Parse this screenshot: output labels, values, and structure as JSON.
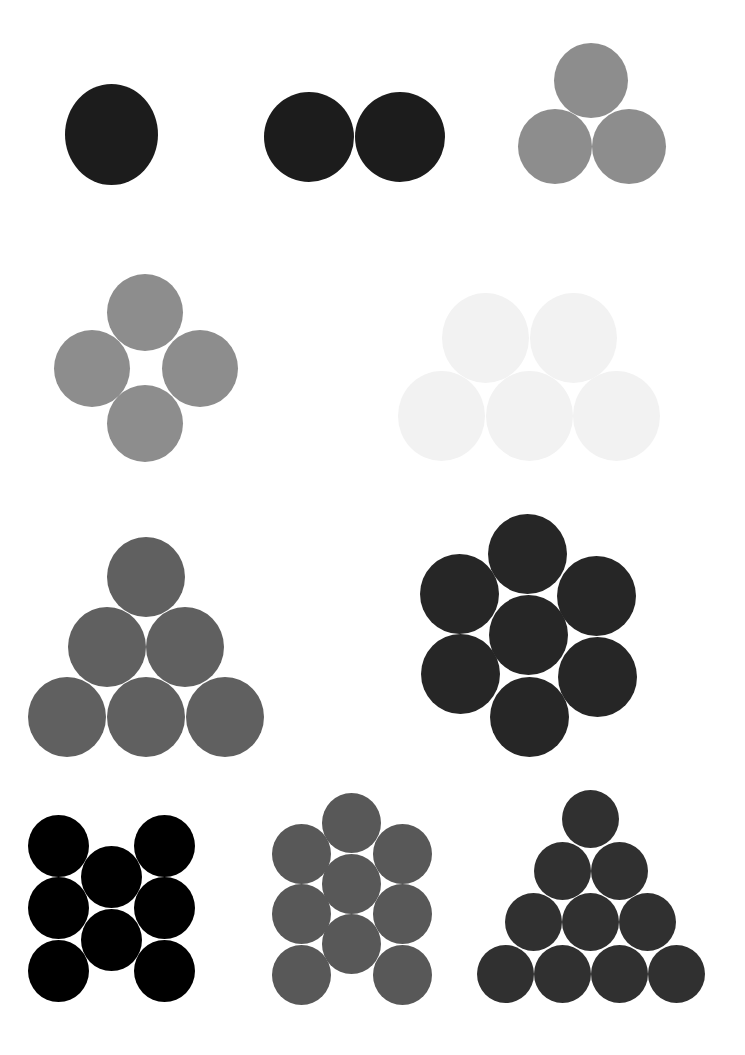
{
  "figure": {
    "background": "#ffffff",
    "groups": [
      {
        "id": "group-1",
        "count": 1,
        "arrangement": "single",
        "color": "#1c1c1c",
        "circles": [
          {
            "cx": 111,
            "cy": 134,
            "w": 93,
            "h": 101
          }
        ]
      },
      {
        "id": "group-2",
        "count": 2,
        "arrangement": "pair-horizontal",
        "color": "#1c1c1c",
        "circles": [
          {
            "cx": 309,
            "cy": 137,
            "w": 90,
            "h": 90
          },
          {
            "cx": 400,
            "cy": 137,
            "w": 90,
            "h": 90
          }
        ]
      },
      {
        "id": "group-3",
        "count": 3,
        "arrangement": "triangle",
        "color": "#8d8d8d",
        "circles": [
          {
            "cx": 591,
            "cy": 80,
            "w": 74,
            "h": 75
          },
          {
            "cx": 555,
            "cy": 146,
            "w": 74,
            "h": 75
          },
          {
            "cx": 629,
            "cy": 146,
            "w": 74,
            "h": 75
          }
        ]
      },
      {
        "id": "group-4",
        "count": 4,
        "arrangement": "diamond",
        "color": "#8d8d8d",
        "circles": [
          {
            "cx": 145,
            "cy": 312,
            "w": 76,
            "h": 77
          },
          {
            "cx": 92,
            "cy": 368,
            "w": 76,
            "h": 77
          },
          {
            "cx": 200,
            "cy": 368,
            "w": 76,
            "h": 77
          },
          {
            "cx": 145,
            "cy": 423,
            "w": 76,
            "h": 77
          }
        ]
      },
      {
        "id": "group-5",
        "count": 5,
        "arrangement": "two-over-three",
        "color": "#f2f2f2",
        "circles": [
          {
            "cx": 485,
            "cy": 338,
            "w": 87,
            "h": 90
          },
          {
            "cx": 573,
            "cy": 338,
            "w": 87,
            "h": 90
          },
          {
            "cx": 441,
            "cy": 416,
            "w": 87,
            "h": 90
          },
          {
            "cx": 529,
            "cy": 416,
            "w": 87,
            "h": 90
          },
          {
            "cx": 616,
            "cy": 416,
            "w": 87,
            "h": 90
          }
        ]
      },
      {
        "id": "group-6",
        "count": 6,
        "arrangement": "triangle",
        "color": "#606060",
        "circles": [
          {
            "cx": 146,
            "cy": 577,
            "w": 78,
            "h": 80
          },
          {
            "cx": 107,
            "cy": 647,
            "w": 78,
            "h": 80
          },
          {
            "cx": 185,
            "cy": 647,
            "w": 78,
            "h": 80
          },
          {
            "cx": 67,
            "cy": 717,
            "w": 78,
            "h": 80
          },
          {
            "cx": 146,
            "cy": 717,
            "w": 78,
            "h": 80
          },
          {
            "cx": 225,
            "cy": 717,
            "w": 78,
            "h": 80
          }
        ]
      },
      {
        "id": "group-7",
        "count": 7,
        "arrangement": "hexagonal",
        "color": "#262626",
        "circles": [
          {
            "cx": 527,
            "cy": 554,
            "w": 79,
            "h": 80
          },
          {
            "cx": 459,
            "cy": 594,
            "w": 79,
            "h": 80
          },
          {
            "cx": 596,
            "cy": 596,
            "w": 79,
            "h": 80
          },
          {
            "cx": 528,
            "cy": 635,
            "w": 79,
            "h": 80
          },
          {
            "cx": 460,
            "cy": 674,
            "w": 79,
            "h": 80
          },
          {
            "cx": 597,
            "cy": 677,
            "w": 79,
            "h": 80
          },
          {
            "cx": 529,
            "cy": 717,
            "w": 79,
            "h": 80
          }
        ]
      },
      {
        "id": "group-8",
        "count": 8,
        "arrangement": "three-columns-3-2-3",
        "color": "#000000",
        "circles": [
          {
            "cx": 58,
            "cy": 846,
            "w": 61,
            "h": 62
          },
          {
            "cx": 58,
            "cy": 908,
            "w": 61,
            "h": 62
          },
          {
            "cx": 58,
            "cy": 971,
            "w": 61,
            "h": 62
          },
          {
            "cx": 111,
            "cy": 877,
            "w": 61,
            "h": 62
          },
          {
            "cx": 111,
            "cy": 940,
            "w": 61,
            "h": 62
          },
          {
            "cx": 164,
            "cy": 846,
            "w": 61,
            "h": 62
          },
          {
            "cx": 164,
            "cy": 908,
            "w": 61,
            "h": 62
          },
          {
            "cx": 164,
            "cy": 971,
            "w": 61,
            "h": 62
          }
        ]
      },
      {
        "id": "group-9",
        "count": 9,
        "arrangement": "three-columns-3-3-3-offset",
        "color": "#585858",
        "circles": [
          {
            "cx": 351,
            "cy": 823,
            "w": 59,
            "h": 60
          },
          {
            "cx": 351,
            "cy": 884,
            "w": 59,
            "h": 60
          },
          {
            "cx": 351,
            "cy": 944,
            "w": 59,
            "h": 60
          },
          {
            "cx": 301,
            "cy": 854,
            "w": 59,
            "h": 60
          },
          {
            "cx": 301,
            "cy": 914,
            "w": 59,
            "h": 60
          },
          {
            "cx": 301,
            "cy": 975,
            "w": 59,
            "h": 60
          },
          {
            "cx": 402,
            "cy": 854,
            "w": 59,
            "h": 60
          },
          {
            "cx": 402,
            "cy": 914,
            "w": 59,
            "h": 60
          },
          {
            "cx": 402,
            "cy": 975,
            "w": 59,
            "h": 60
          }
        ]
      },
      {
        "id": "group-10",
        "count": 10,
        "arrangement": "triangle",
        "color": "#303030",
        "circles": [
          {
            "cx": 590,
            "cy": 819,
            "w": 57,
            "h": 58
          },
          {
            "cx": 562,
            "cy": 871,
            "w": 57,
            "h": 58
          },
          {
            "cx": 619,
            "cy": 871,
            "w": 57,
            "h": 58
          },
          {
            "cx": 533,
            "cy": 922,
            "w": 57,
            "h": 58
          },
          {
            "cx": 590,
            "cy": 922,
            "w": 57,
            "h": 58
          },
          {
            "cx": 647,
            "cy": 922,
            "w": 57,
            "h": 58
          },
          {
            "cx": 505,
            "cy": 974,
            "w": 57,
            "h": 58
          },
          {
            "cx": 562,
            "cy": 974,
            "w": 57,
            "h": 58
          },
          {
            "cx": 619,
            "cy": 974,
            "w": 57,
            "h": 58
          },
          {
            "cx": 676,
            "cy": 974,
            "w": 57,
            "h": 58
          }
        ]
      }
    ]
  }
}
